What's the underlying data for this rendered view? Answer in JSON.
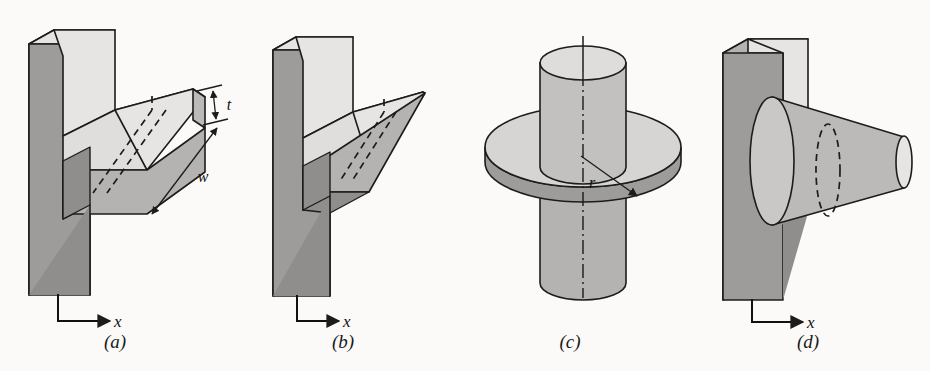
{
  "figure": {
    "background_color": "#fbfaf8",
    "line_color": "#1c1c1c"
  },
  "palette": {
    "face_light": "#e6e5e3",
    "face_mid": "#c9c8c6",
    "face_dark": "#9d9c9a",
    "face_darker": "#8f8e8c",
    "outline": "#1c1c1c"
  },
  "panels": [
    {
      "id": "a",
      "caption": "(a)",
      "description": "straight rectangular fin on a plane wall",
      "caption_x": 115,
      "axis_label": "x",
      "dimensions": [
        {
          "name": "thickness",
          "label": "t"
        },
        {
          "name": "width",
          "label": "w"
        }
      ]
    },
    {
      "id": "b",
      "caption": "(b)",
      "description": "straight triangular fin on a plane wall",
      "caption_x": 343,
      "axis_label": "x",
      "dimensions": []
    },
    {
      "id": "c",
      "caption": "(c)",
      "description": "annular disk fin on a cylindrical tube",
      "caption_x": 570,
      "axis_label": "",
      "dimensions": [
        {
          "name": "radius",
          "label": "r"
        }
      ]
    },
    {
      "id": "d",
      "caption": "(d)",
      "description": "truncated conical pin fin on a plane wall",
      "caption_x": 808,
      "axis_label": "x",
      "dimensions": []
    }
  ]
}
